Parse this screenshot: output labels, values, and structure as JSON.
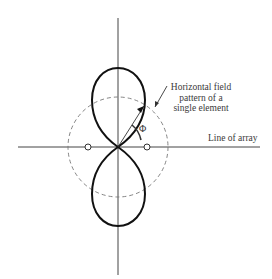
{
  "diagram": {
    "labels": {
      "field_pattern": [
        "Horizontal field",
        "pattern of a",
        "single element"
      ],
      "line_of_array": "Line of array",
      "angle": "Φ"
    },
    "elements": {
      "count": 2,
      "description": "two open-circle antenna elements on the line of array"
    },
    "colors": {
      "lobe": "#111111",
      "axis": "#444444",
      "dashed_circle": "#777777",
      "background": "#ffffff"
    }
  }
}
